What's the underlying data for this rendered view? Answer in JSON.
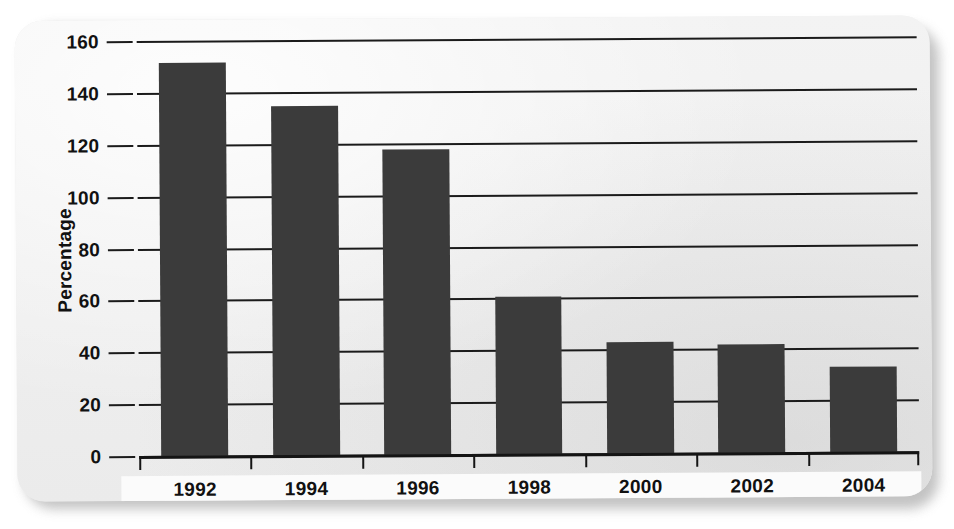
{
  "figure": {
    "card_background": "#efefef",
    "page_background": "#ffffff",
    "bar_color": "#3b3b3b",
    "axis_color": "#141414"
  },
  "chart_data": {
    "type": "bar",
    "title": "",
    "subtitle": "",
    "xlabel": "",
    "ylabel": "Percentage",
    "categories": [
      "1992",
      "1994",
      "1996",
      "1998",
      "2000",
      "2002",
      "2004"
    ],
    "values": [
      152,
      135,
      118,
      61,
      43,
      42,
      33
    ],
    "series": [
      {
        "name": "Percentage",
        "values": [
          152,
          135,
          118,
          61,
          43,
          42,
          33
        ]
      }
    ],
    "ylim": [
      0,
      160
    ],
    "ytick_values": [
      0,
      20,
      40,
      60,
      80,
      100,
      120,
      140,
      160
    ],
    "ytick_labels": [
      "0",
      "20",
      "40",
      "60",
      "80",
      "100",
      "120",
      "140",
      "160"
    ],
    "grid": true,
    "grid_axis": "y",
    "legend": false,
    "legend_position": "none",
    "annotations": []
  }
}
